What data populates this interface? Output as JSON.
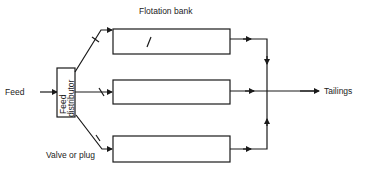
{
  "diagram": {
    "type": "flowsheet",
    "labels": {
      "feed": "Feed",
      "distributor_line1": "Feed",
      "distributor_line2": "distributor",
      "flotation_bank": "Flotation bank",
      "tailings": "Tailings",
      "valve": "Valve or plug"
    },
    "banks": [
      {
        "name": "Flotation bank 1"
      },
      {
        "name": "Flotation bank 2"
      },
      {
        "name": "Flotation bank 3"
      }
    ],
    "colors": {
      "line": "#1a1a1a",
      "background": "#ffffff"
    }
  }
}
